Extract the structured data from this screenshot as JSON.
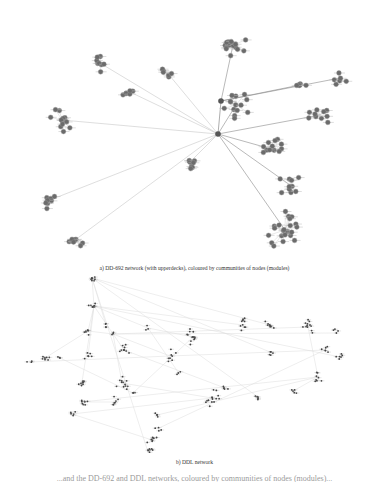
{
  "figure": {
    "panel_a": {
      "caption": "a) DD-692 network (with upperdecks), coloured by communities of nodes (modules)",
      "node_color": "#6b6b6b",
      "edge_color": "#c8c8c8",
      "hub_edge_color": "#8a8a8a",
      "hubs": [
        [
          221,
          101
        ],
        [
          218,
          134
        ]
      ],
      "clusters": [
        {
          "cx": 233,
          "cy": 45,
          "n": 16,
          "r": 14
        },
        {
          "cx": 165,
          "cy": 70,
          "n": 6,
          "r": 8
        },
        {
          "cx": 100,
          "cy": 63,
          "n": 8,
          "r": 10
        },
        {
          "cx": 130,
          "cy": 92,
          "n": 6,
          "r": 9
        },
        {
          "cx": 236,
          "cy": 105,
          "n": 14,
          "r": 14
        },
        {
          "cx": 62,
          "cy": 120,
          "n": 14,
          "r": 14
        },
        {
          "cx": 300,
          "cy": 85,
          "n": 6,
          "r": 8
        },
        {
          "cx": 340,
          "cy": 78,
          "n": 6,
          "r": 8
        },
        {
          "cx": 320,
          "cy": 115,
          "n": 10,
          "r": 12
        },
        {
          "cx": 275,
          "cy": 150,
          "n": 12,
          "r": 12
        },
        {
          "cx": 190,
          "cy": 162,
          "n": 8,
          "r": 9
        },
        {
          "cx": 50,
          "cy": 200,
          "n": 8,
          "r": 10
        },
        {
          "cx": 75,
          "cy": 240,
          "n": 10,
          "r": 11
        },
        {
          "cx": 290,
          "cy": 185,
          "n": 10,
          "r": 12
        },
        {
          "cx": 285,
          "cy": 230,
          "n": 22,
          "r": 20
        }
      ]
    },
    "panel_b": {
      "caption": "b) DDL network",
      "node_color": "#444444",
      "edge_color": "#dddddd",
      "clusters": [
        {
          "cx": 92,
          "cy": 278,
          "n": 8,
          "r": 5
        },
        {
          "cx": 94,
          "cy": 306,
          "n": 9,
          "r": 6
        },
        {
          "cx": 106,
          "cy": 325,
          "n": 4,
          "r": 3
        },
        {
          "cx": 88,
          "cy": 331,
          "n": 7,
          "r": 5
        },
        {
          "cx": 124,
          "cy": 350,
          "n": 10,
          "r": 6
        },
        {
          "cx": 148,
          "cy": 328,
          "n": 3,
          "r": 3
        },
        {
          "cx": 113,
          "cy": 334,
          "n": 3,
          "r": 3
        },
        {
          "cx": 45,
          "cy": 358,
          "n": 8,
          "r": 7
        },
        {
          "cx": 88,
          "cy": 356,
          "n": 6,
          "r": 5
        },
        {
          "cx": 193,
          "cy": 337,
          "n": 14,
          "r": 9
        },
        {
          "cx": 170,
          "cy": 356,
          "n": 8,
          "r": 7
        },
        {
          "cx": 178,
          "cy": 372,
          "n": 3,
          "r": 3
        },
        {
          "cx": 243,
          "cy": 325,
          "n": 10,
          "r": 7
        },
        {
          "cx": 270,
          "cy": 325,
          "n": 10,
          "r": 7
        },
        {
          "cx": 308,
          "cy": 327,
          "n": 12,
          "r": 8
        },
        {
          "cx": 336,
          "cy": 333,
          "n": 4,
          "r": 4
        },
        {
          "cx": 270,
          "cy": 352,
          "n": 5,
          "r": 4
        },
        {
          "cx": 325,
          "cy": 350,
          "n": 6,
          "r": 5
        },
        {
          "cx": 340,
          "cy": 357,
          "n": 6,
          "r": 5
        },
        {
          "cx": 82,
          "cy": 382,
          "n": 8,
          "r": 6
        },
        {
          "cx": 122,
          "cy": 383,
          "n": 12,
          "r": 8
        },
        {
          "cx": 133,
          "cy": 393,
          "n": 3,
          "r": 3
        },
        {
          "cx": 318,
          "cy": 377,
          "n": 8,
          "r": 6
        },
        {
          "cx": 295,
          "cy": 390,
          "n": 5,
          "r": 4
        },
        {
          "cx": 212,
          "cy": 398,
          "n": 14,
          "r": 9
        },
        {
          "cx": 225,
          "cy": 388,
          "n": 5,
          "r": 4
        },
        {
          "cx": 258,
          "cy": 397,
          "n": 5,
          "r": 4
        },
        {
          "cx": 82,
          "cy": 402,
          "n": 8,
          "r": 6
        },
        {
          "cx": 115,
          "cy": 402,
          "n": 7,
          "r": 6
        },
        {
          "cx": 72,
          "cy": 414,
          "n": 5,
          "r": 4
        },
        {
          "cx": 157,
          "cy": 415,
          "n": 4,
          "r": 3
        },
        {
          "cx": 159,
          "cy": 428,
          "n": 4,
          "r": 4
        },
        {
          "cx": 152,
          "cy": 440,
          "n": 8,
          "r": 6
        },
        {
          "cx": 148,
          "cy": 452,
          "n": 7,
          "r": 6
        },
        {
          "cx": 30,
          "cy": 362,
          "n": 3,
          "r": 3
        },
        {
          "cx": 60,
          "cy": 358,
          "n": 3,
          "r": 3
        }
      ]
    },
    "bottom_text_cutoff": "...and the DD-692 and DDL networks, coloured by communities of nodes (modules)..."
  }
}
